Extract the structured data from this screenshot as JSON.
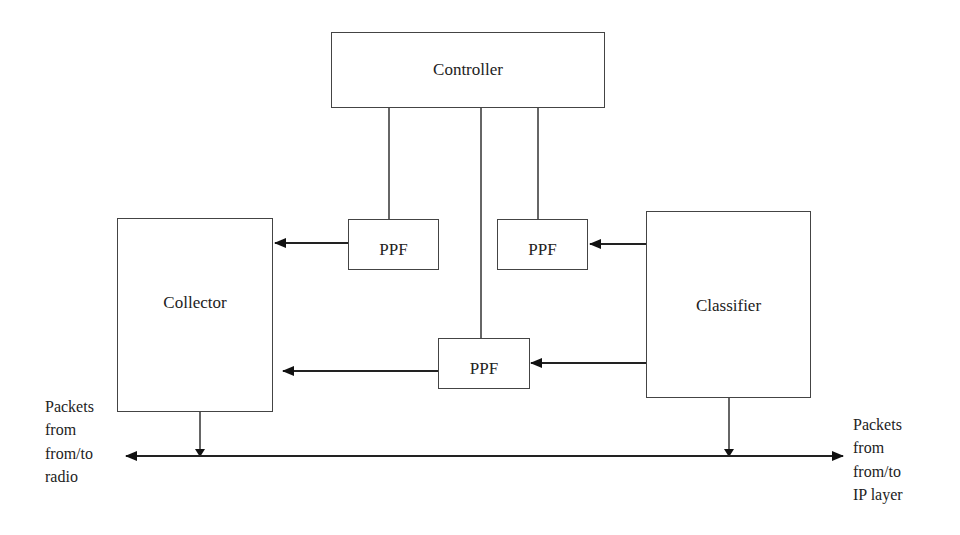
{
  "diagram": {
    "nodes": {
      "controller": {
        "label": "Controller"
      },
      "collector": {
        "label": "Collector"
      },
      "classifier": {
        "label": "Classifier"
      },
      "ppf_top_left": {
        "label": "PPF"
      },
      "ppf_top_right": {
        "label": "PPF"
      },
      "ppf_middle": {
        "label": "PPF"
      }
    },
    "annotations": {
      "left": {
        "lines": [
          "Packets",
          "from",
          "from/to",
          "radio"
        ]
      },
      "right": {
        "lines": [
          "Packets",
          "from",
          "from/to",
          "IP layer"
        ]
      }
    },
    "edges": [
      {
        "from": "controller",
        "to": "ppf_top_left",
        "type": "line"
      },
      {
        "from": "controller",
        "to": "ppf_middle",
        "type": "line"
      },
      {
        "from": "controller",
        "to": "ppf_top_right",
        "type": "line"
      },
      {
        "from": "ppf_top_left",
        "to": "collector",
        "type": "arrow"
      },
      {
        "from": "classifier",
        "to": "ppf_top_right",
        "type": "arrow"
      },
      {
        "from": "classifier",
        "to": "ppf_middle",
        "type": "arrow"
      },
      {
        "from": "ppf_middle",
        "to": "collector",
        "type": "arrow"
      },
      {
        "from": "collector",
        "to": "bus",
        "type": "arrow"
      },
      {
        "from": "classifier",
        "to": "bus",
        "type": "arrow"
      },
      {
        "from": "bus",
        "to": "radio",
        "type": "arrow"
      },
      {
        "from": "bus",
        "to": "ip_layer",
        "type": "arrow"
      }
    ]
  }
}
